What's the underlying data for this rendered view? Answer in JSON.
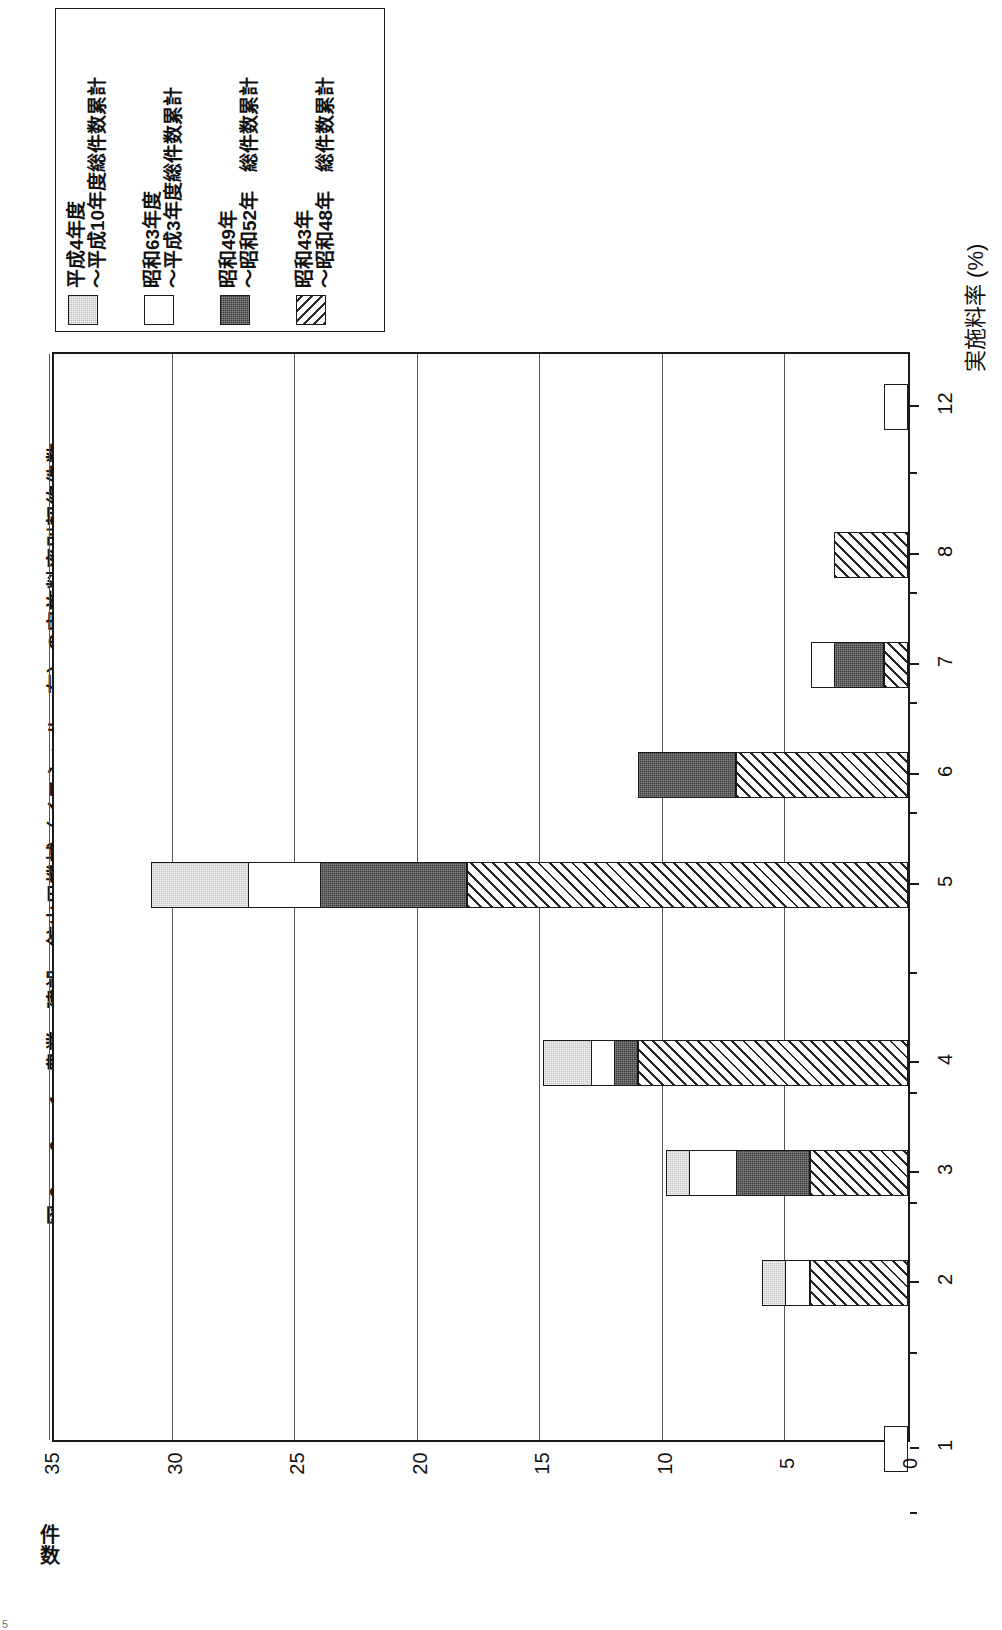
{
  "figure": {
    "number": "図 2 － 9 － 1",
    "title": "図 2 － 9 － 1　農業・建設・鉱山用機械（イニシャル　有）の実施料率別契約件数",
    "folio": "5"
  },
  "legend": {
    "entries": [
      {
        "swatch": "gray-swatch",
        "label": "平成4年度\n～平成10年度総件数累計"
      },
      {
        "swatch": "white-swatch",
        "label": "昭和63年度\n～平成3年度総件数累計"
      },
      {
        "swatch": "dark-swatch",
        "label": "昭和49年\n～昭和52年　総件数累計"
      },
      {
        "swatch": "hatch-swatch",
        "label": "昭和43年\n～昭和48年　総件数累計"
      }
    ]
  },
  "axes": {
    "x_title": "実施料率 (%)",
    "y_title": "件\n数",
    "y_ticks": [
      "35",
      "30",
      "25",
      "20",
      "15",
      "10",
      "5",
      "0"
    ],
    "x_ticks": [
      "1",
      "2",
      "3",
      "4",
      "5",
      "6",
      "7",
      "8",
      "12"
    ]
  },
  "chart_data": {
    "type": "bar",
    "orientation": "horizontal-rotated",
    "title": "農業・建設・鉱山用機械（イニシャル　有）の実施料率別契約件数",
    "xlabel": "実施料率 (%)",
    "ylabel": "件数",
    "ylim": [
      0,
      35
    ],
    "grid": true,
    "legend_position": "top-left",
    "categories": [
      "1",
      "2",
      "3",
      "4",
      "5",
      "6",
      "7",
      "8",
      "12"
    ],
    "series": [
      {
        "name": "昭和43年～昭和48年 総件数累計",
        "style": "hatch",
        "values": [
          0,
          4,
          4,
          11,
          18,
          7,
          1,
          3,
          0
        ]
      },
      {
        "name": "昭和49年～昭和52年 総件数累計",
        "style": "dark",
        "values": [
          0,
          0,
          3,
          1,
          6,
          4,
          2,
          0,
          0
        ]
      },
      {
        "name": "昭和63年度～平成3年度総件数累計",
        "style": "white",
        "values": [
          1,
          1,
          2,
          1,
          3,
          0,
          1,
          0,
          1
        ]
      },
      {
        "name": "平成4年度～平成10年度総件数累計",
        "style": "gray",
        "values": [
          0,
          1,
          1,
          2,
          4,
          0,
          0,
          0,
          0
        ]
      }
    ],
    "totals": [
      1,
      6,
      10,
      15,
      31,
      11,
      4,
      3,
      1
    ]
  },
  "render": {
    "unit_px": 24.51,
    "bar_rows_top": [
      {
        "cat": "1",
        "top": 1072
      },
      {
        "cat": "2",
        "top": 906
      },
      {
        "cat": "3",
        "top": 796
      },
      {
        "cat": "4",
        "top": 686
      },
      {
        "cat": "5",
        "top": 508
      },
      {
        "cat": "6",
        "top": 398
      },
      {
        "cat": "7",
        "top": 288
      },
      {
        "cat": "8",
        "top": 178
      },
      {
        "cat": "12",
        "top": 30
      }
    ]
  }
}
